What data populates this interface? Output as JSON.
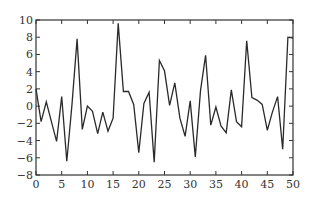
{
  "chart_data": {
    "type": "line",
    "title": "",
    "xlabel": "",
    "ylabel": "",
    "xlim": [
      0,
      50
    ],
    "ylim": [
      -8,
      10
    ],
    "grid": false,
    "legend": null,
    "x_ticks": [
      0,
      5,
      10,
      15,
      20,
      25,
      30,
      35,
      40,
      45,
      50
    ],
    "y_ticks": [
      -8,
      -6,
      -4,
      -2,
      0,
      2,
      4,
      6,
      8,
      10
    ],
    "x_tick_labels": [
      "0",
      "5",
      "10",
      "15",
      "20",
      "25",
      "30",
      "35",
      "40",
      "45",
      "50"
    ],
    "y_tick_labels": [
      "−8",
      "−6",
      "−4",
      "−2",
      "0",
      "2",
      "4",
      "6",
      "8",
      "10"
    ],
    "series": [
      {
        "name": "series-1",
        "color": "#2a2a2a",
        "x": [
          0,
          1,
          2,
          3,
          4,
          5,
          6,
          7,
          8,
          9,
          10,
          11,
          12,
          13,
          14,
          15,
          16,
          17,
          18,
          19,
          20,
          21,
          22,
          23,
          24,
          25,
          26,
          27,
          28,
          29,
          30,
          31,
          32,
          33,
          34,
          35,
          36,
          37,
          38,
          39,
          40,
          41,
          42,
          43,
          44,
          45,
          46,
          47,
          48,
          49,
          50
        ],
        "values": [
          2.0,
          -1.8,
          0.5,
          -1.8,
          -4.1,
          1.1,
          -6.4,
          0.2,
          7.8,
          -2.7,
          0.0,
          -0.6,
          -3.2,
          -0.7,
          -2.9,
          -1.4,
          9.6,
          1.7,
          1.7,
          0.2,
          -5.4,
          0.3,
          1.6,
          -6.5,
          5.3,
          4.1,
          0.1,
          2.7,
          -1.4,
          -3.5,
          0.6,
          -5.9,
          1.8,
          5.9,
          -2.2,
          -0.1,
          -2.3,
          -3.1,
          1.9,
          -1.8,
          -2.4,
          7.6,
          1.0,
          0.7,
          0.2,
          -2.8,
          -0.7,
          1.1,
          -5.0,
          8.0,
          7.9
        ]
      }
    ]
  }
}
